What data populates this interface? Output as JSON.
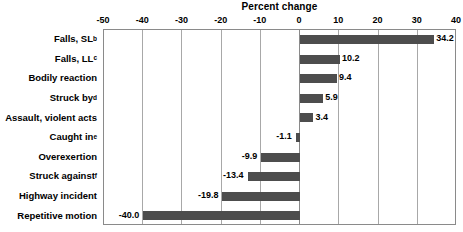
{
  "chart_data": {
    "type": "bar",
    "orientation": "horizontal",
    "title": "Percent change",
    "xlabel": "Percent change",
    "ylabel": "",
    "xlim": [
      -50,
      40
    ],
    "xticks": [
      -50,
      -40,
      -30,
      -20,
      -10,
      0,
      10,
      20,
      30,
      40
    ],
    "xtick_labels": [
      "-50",
      "-40",
      "-30",
      "-20",
      "-10",
      "0",
      "10",
      "20",
      "30",
      "40"
    ],
    "grid": true,
    "grid_axis": "x",
    "legend": null,
    "bar_color": "#4d4d4d",
    "categories": [
      "Falls, SL",
      "Falls, LL",
      "Bodily reaction",
      "Struck by",
      "Assault, violent acts",
      "Caught in",
      "Overexertion",
      "Struck against",
      "Highway incident",
      "Repetitive motion"
    ],
    "category_footnotes": [
      "b",
      "c",
      "",
      "d",
      "",
      "e",
      "",
      "f",
      "",
      ""
    ],
    "values": [
      34.2,
      10.2,
      9.4,
      5.9,
      3.4,
      -1.1,
      -9.9,
      -13.4,
      -19.8,
      -40.0
    ],
    "value_labels": [
      "34.2",
      "10.2",
      "9.4",
      "5.9",
      "3.4",
      "-1.1",
      "-9.9",
      "-13.4",
      "-19.8",
      "-40.0"
    ]
  }
}
